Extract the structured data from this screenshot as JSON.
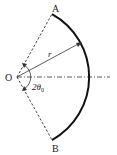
{
  "diagram": {
    "type": "circular-sector",
    "labels": {
      "point_a": "A",
      "point_b": "B",
      "center": "O",
      "radius": "r",
      "angle": "2θ",
      "angle_subscript": "0"
    },
    "colors": {
      "stroke": "#222222",
      "background": "#ffffff"
    }
  }
}
